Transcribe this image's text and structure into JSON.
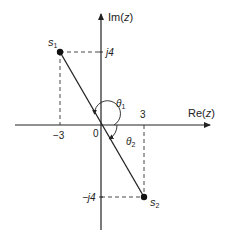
{
  "diagram": {
    "type": "complex-plane",
    "axes": {
      "x_label": "Re(z)",
      "y_label": "Im(z)",
      "origin_label": "0"
    },
    "ticks": {
      "x_neg": "−3",
      "x_pos": "3",
      "y_pos": "j4",
      "y_neg": "−j4"
    },
    "points": [
      {
        "name": "s1",
        "label": "s",
        "subscript": "1",
        "re": -3,
        "im": 4
      },
      {
        "name": "s2",
        "label": "s",
        "subscript": "2",
        "re": 3,
        "im": -4
      }
    ],
    "angles": [
      {
        "name": "theta1",
        "label": "θ",
        "subscript": "1"
      },
      {
        "name": "theta2",
        "label": "θ",
        "subscript": "2"
      }
    ],
    "colors": {
      "ink": "#222222",
      "background": "#ffffff"
    }
  }
}
